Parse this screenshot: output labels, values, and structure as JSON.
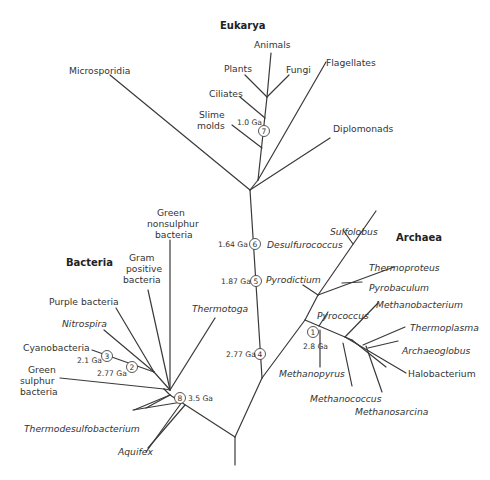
{
  "domains": {
    "eukarya": "Eukarya",
    "bacteria": "Bacteria",
    "archaea": "Archaea"
  },
  "eukarya_taxa": {
    "microsporidia": "Microsporidia",
    "animals": "Animals",
    "plants": "Plants",
    "fungi": "Fungi",
    "flagellates": "Flagellates",
    "ciliates": "Ciliates",
    "slime_molds_1": "Slime",
    "slime_molds_2": "molds",
    "diplomonads": "Diplomonads"
  },
  "bacteria_taxa": {
    "green_nonsulphur_1": "Green",
    "green_nonsulphur_2": "nonsulphur",
    "green_nonsulphur_3": "bacteria",
    "gram_positive_1": "Gram",
    "gram_positive_2": "positive",
    "gram_positive_3": "bacteria",
    "purple_bacteria": "Purple bacteria",
    "nitrospira": "Nitrospira",
    "cyanobacteria": "Cyanobacteria",
    "green_sulphur_1": "Green",
    "green_sulphur_2": "sulphur",
    "green_sulphur_3": "bacteria",
    "thermotoga": "Thermotoga",
    "thermodesulfobacterium": "Thermodesulfobacterium",
    "aquifex": "Aquifex"
  },
  "archaea_taxa": {
    "sulfolobus": "Sulfolobus",
    "desulfurococcus": "Desulfurococcus",
    "thermoproteus": "Thermoproteus",
    "pyrobaculum": "Pyrobaculum",
    "pyrodictium": "Pyrodictium",
    "pyrococcus": "Pyrococcus",
    "methanobacterium": "Methanobacterium",
    "thermoplasma": "Thermoplasma",
    "archaeoglobus": "Archaeoglobus",
    "halobacterium": "Halobacterium",
    "methanopyrus": "Methanopyrus",
    "methanococcus": "Methanococcus",
    "methanosarcina": "Methanosarcina"
  },
  "nodes": [
    {
      "id": "1",
      "age": "2.8 Ga"
    },
    {
      "id": "2",
      "age": "2.77 Ga"
    },
    {
      "id": "3",
      "age": "2.1 Ga"
    },
    {
      "id": "4",
      "age": "2.77 Ga"
    },
    {
      "id": "5",
      "age": "1.87 Ga"
    },
    {
      "id": "6",
      "age": "1.64 Ga"
    },
    {
      "id": "7",
      "age": "1.0 Ga"
    },
    {
      "id": "8",
      "age": "3.5 Ga"
    }
  ]
}
